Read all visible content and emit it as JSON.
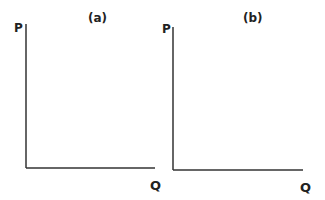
{
  "panels": [
    {
      "title": "(a)",
      "y_axis_label": "P",
      "x_axis_label": "Q"
    },
    {
      "title": "(b)",
      "y_axis_label": "P",
      "x_axis_label": "Q"
    }
  ],
  "colors": {
    "axis": "#333333",
    "text": "#222222",
    "background": "#ffffff"
  }
}
